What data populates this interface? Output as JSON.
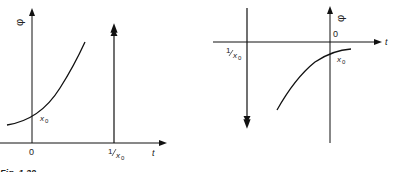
{
  "figure": {
    "caption": "Fig. 1.20",
    "left_panel": {
      "y_axis_label": "φ",
      "x_axis_label": "t",
      "origin_label": "0",
      "curve_label": "x",
      "curve_label_sub": "0",
      "impulse_label_num": "1",
      "impulse_label_den": "x",
      "impulse_label_sub": "0"
    },
    "right_panel": {
      "y_axis_label": "φ",
      "x_axis_label": "t",
      "origin_label": "0",
      "curve_label": "x",
      "curve_label_sub": "0",
      "impulse_label_num": "1",
      "impulse_label_den": "x",
      "impulse_label_sub": "0"
    }
  }
}
